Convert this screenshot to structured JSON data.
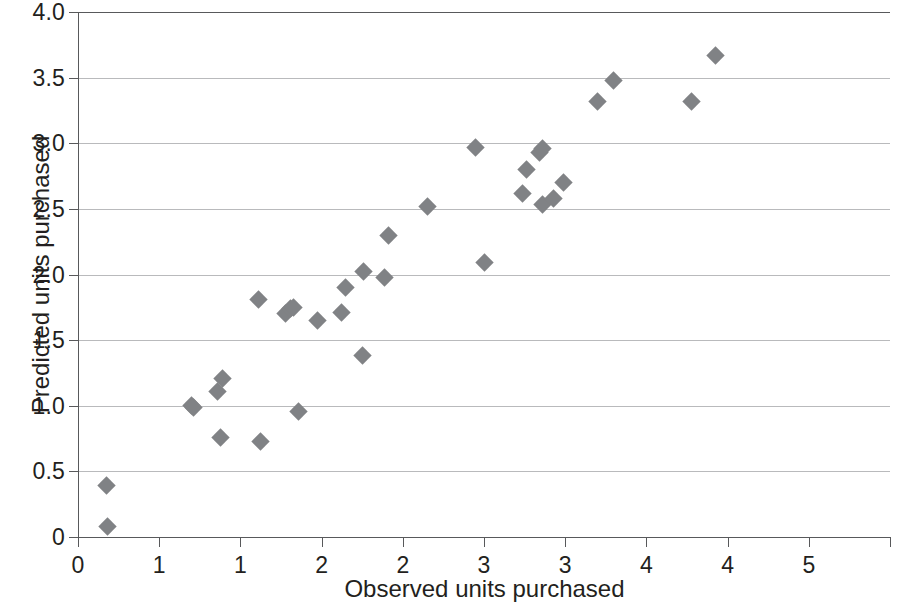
{
  "chart_data": {
    "type": "scatter",
    "title": "",
    "xlabel": "Observed units purchased",
    "ylabel": "Predicted units purchased",
    "xlim": [
      0,
      5
    ],
    "ylim": [
      0,
      4
    ],
    "grid": true,
    "legend": null,
    "marker": {
      "shape": "diamond",
      "color": "#808285",
      "size": 13
    },
    "xticks": [
      0,
      0.5,
      1,
      1.5,
      2,
      2.5,
      3,
      3.5,
      4,
      4.5,
      5
    ],
    "xtick_labels": [
      "0",
      "1",
      "1",
      "2",
      "2",
      "3",
      "3",
      "4",
      "4",
      "5"
    ],
    "xtick_label_values": [
      0,
      0.5,
      1,
      1.5,
      2,
      2.5,
      3,
      3.5,
      4,
      4.5,
      5
    ],
    "yticks": [
      0,
      0.5,
      1.0,
      1.5,
      2.0,
      2.5,
      3.0,
      3.5,
      4.0
    ],
    "ytick_labels": [
      "0",
      "0.5",
      "1.0",
      "1.5",
      "2.0",
      "2.5",
      "3.0",
      "3.5",
      "4.0"
    ],
    "points": [
      {
        "x": 0.35,
        "y": 0.39
      },
      {
        "x": 0.36,
        "y": 0.08
      },
      {
        "x": 1.4,
        "y": 1.0
      },
      {
        "x": 1.42,
        "y": 0.99
      },
      {
        "x": 1.72,
        "y": 1.11
      },
      {
        "x": 1.78,
        "y": 1.21
      },
      {
        "x": 1.75,
        "y": 0.76
      },
      {
        "x": 2.25,
        "y": 0.73
      },
      {
        "x": 2.22,
        "y": 1.81
      },
      {
        "x": 2.55,
        "y": 1.7
      },
      {
        "x": 2.62,
        "y": 1.74
      },
      {
        "x": 2.65,
        "y": 1.75
      },
      {
        "x": 2.72,
        "y": 0.96
      },
      {
        "x": 2.95,
        "y": 1.65
      },
      {
        "x": 3.25,
        "y": 1.71
      },
      {
        "x": 3.3,
        "y": 1.9
      },
      {
        "x": 3.52,
        "y": 2.02
      },
      {
        "x": 3.5,
        "y": 1.38
      },
      {
        "x": 3.78,
        "y": 1.98
      },
      {
        "x": 3.82,
        "y": 2.3
      },
      {
        "x": 4.3,
        "y": 2.52
      },
      {
        "x": 4.9,
        "y": 2.97
      },
      {
        "x": 5.0,
        "y": 2.09
      },
      {
        "x": 5.48,
        "y": 2.62
      },
      {
        "x": 5.52,
        "y": 2.8
      },
      {
        "x": 5.68,
        "y": 2.93
      },
      {
        "x": 5.72,
        "y": 2.96
      },
      {
        "x": 5.72,
        "y": 2.53
      },
      {
        "x": 5.85,
        "y": 2.58
      },
      {
        "x": 5.98,
        "y": 2.7
      },
      {
        "x": 6.4,
        "y": 3.32
      },
      {
        "x": 6.6,
        "y": 3.48
      },
      {
        "x": 7.55,
        "y": 3.32
      },
      {
        "x": 7.85,
        "y": 3.67
      }
    ],
    "points_note": "x values expressed in plotted axis units (0-5 scale uses half-unit ticks labelled as rounded integers)"
  },
  "axes": {
    "y_title": "Predicted units purchased",
    "x_title": "Observed units purchased"
  }
}
